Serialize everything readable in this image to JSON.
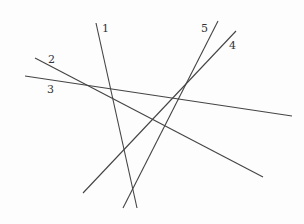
{
  "diagram": {
    "type": "line-arrangement",
    "canvas": {
      "width": 304,
      "height": 224,
      "background": "#fdfdfd"
    },
    "line_color": "#444444",
    "label_color": "#333333",
    "lines": [
      {
        "id": "1",
        "label": "1",
        "x1": 96,
        "y1": 23,
        "x2": 137,
        "y2": 208,
        "label_x": 102,
        "label_y": 32
      },
      {
        "id": "2",
        "label": "2",
        "x1": 35,
        "y1": 58,
        "x2": 263,
        "y2": 177,
        "label_x": 48,
        "label_y": 63
      },
      {
        "id": "3",
        "label": "3",
        "x1": 25,
        "y1": 76,
        "x2": 292,
        "y2": 116,
        "label_x": 47,
        "label_y": 93
      },
      {
        "id": "4",
        "label": "4",
        "x1": 236,
        "y1": 31,
        "x2": 83,
        "y2": 193,
        "label_x": 229,
        "label_y": 49
      },
      {
        "id": "5",
        "label": "5",
        "x1": 218,
        "y1": 21,
        "x2": 123,
        "y2": 208,
        "label_x": 201,
        "label_y": 32
      }
    ]
  }
}
